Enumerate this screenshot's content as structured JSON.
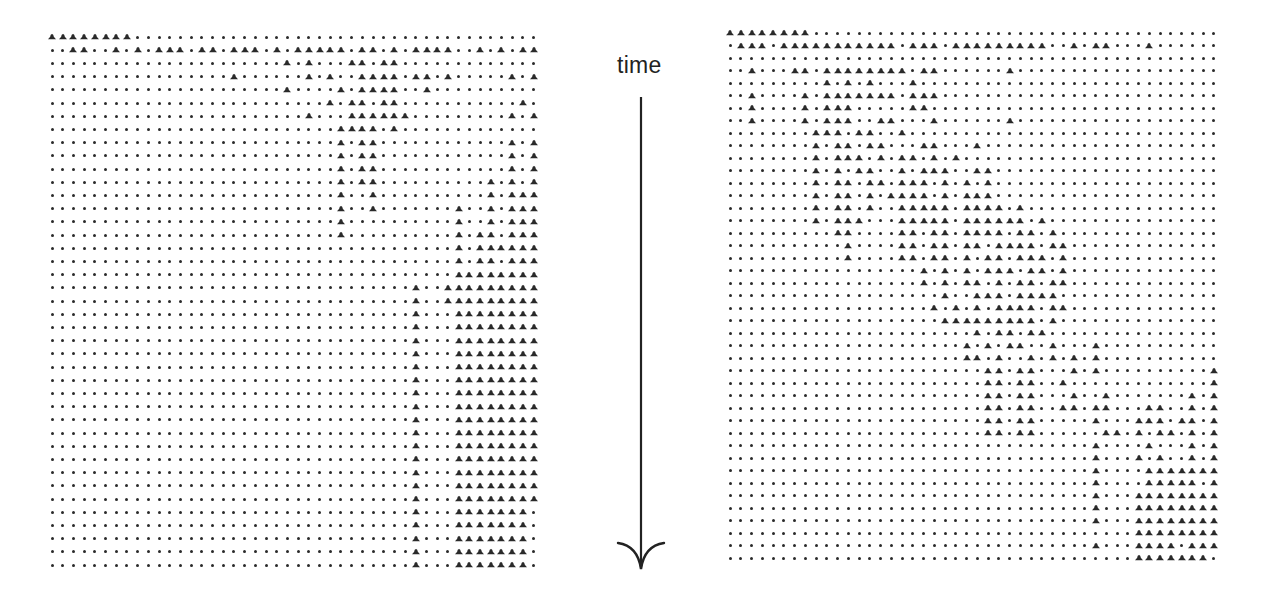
{
  "figure": {
    "axis_label": "time",
    "arrow_direction": "down",
    "symbol_legend": {
      "1": "triangle-marker",
      "0": "dot-marker"
    },
    "ink_color": "#2a2a2a"
  },
  "panels": [
    {
      "id": "left",
      "origin": [
        52,
        37
      ],
      "col_step": 10.7,
      "row_step": 13.2,
      "rows": [
        "1111111100000000000000000000000000000000000000",
        "0011001010111011011101011111011010111100101011",
        "0000000000000000000000101000110110000000000000",
        "0000000000000000010000001010011110110100000101",
        "0000000000000000000000100001011110010000000000",
        "0000000000000000000000000010110110000000000010",
        "0000000000000000000000001000111111000000000101",
        "0000000000000000000000000001111010000000000000",
        "0000000000000000000000000001011000000000000101",
        "0000000000000000000000000001011000000000000101",
        "0000000000000000000000000001011000000000000101",
        "0000000000000000000000000001011000000000010101",
        "0000000000000000000000000001001000000000010111",
        "0000000000000000000000000001001000000010010111",
        "0000000000000000000000000001000000000010010111",
        "0000000000000000000000000001000000000010110111",
        "0000000000000000000000000000000000000010111111",
        "0000000000000000000000000000000000000010110111",
        "0000000000000000000000000000000000000011111111",
        "0000000000000000000000000000000000100111111111",
        "0000000000000000000000000000000000100111111111",
        "0000000000000000000000000000000000100011111111",
        "0000000000000000000000000000000000100011111111",
        "0000000000000000000000000000000000100011111111",
        "0000000000000000000000000000000000100011111111",
        "0000000000000000000000000000000000100011111111",
        "0000000000000000000000000000000000100011111111",
        "0000000000000000000000000000000000100011111111",
        "0000000000000000000000000000000000100011111111",
        "0000000000000000000000000000000000100011111111",
        "0000000000000000000000000000000000100011111111",
        "0000000000000000000000000000000000100011111111",
        "0000000000000000000000000000000000100011111111",
        "0000000000000000000000000000000000100011111111",
        "0000000000000000000000000000000000100011111111",
        "0000000000000000000000000000000000100011111111",
        "0000000000000000000000000000000000100011111110",
        "0000000000000000000000000000000000100011111110",
        "0000000000000000000000000000000000100011111110",
        "0000000000000000000000000000000000100011111110",
        "0000000000000000000000000000000000100011111110"
      ]
    },
    {
      "id": "right",
      "origin": [
        730,
        33
      ],
      "col_step": 10.75,
      "row_step": 12.5,
      "rows": [
        "1111111100000000000000000000000000000000000000",
        "0111011111111111011101111111110010110001000000",
        "0000000000000000000000000000000000000000000000",
        "0010001101111111101100000010000000000000000000",
        "0000000001010100010000000000000000000000000000",
        "0010000101111111011100000000000000000000000000",
        "0010000101110000011000000000000000000000000000",
        "0010000101110011000100000010000000000000000000",
        "0000000011101100100000000000000000000000000000",
        "0000000010110110001100010000000000000000000000",
        "0000000010111010110101000000000000000000000000",
        "0000000010101100101110011000000000000000000000",
        "0000000010110110111010101000000000000000000000",
        "0000000010110101111010111000000000000000000000",
        "0000000010110100111110111101000000000000000000",
        "0000000010111000111110111111010000000000000000",
        "0000000000110000110110111101101000000000000000",
        "0000000000010000110110110111101100000000000000",
        "0000000000010000110110101101110100000000000000",
        "0000000000000000001010101110110100000000000000",
        "0000000000000000001010110101101100000000000000",
        "0000000000000000000010011101111000000000000000",
        "0000000000000000000101010111101100000000000000",
        "0000000000000000000011111111101000000000000000",
        "0000000000000000000000010110110000000000000000",
        "0000000000000000000000101011001000100000000000",
        "0000000000000000000000110100101010100000000000",
        "0000000000000000000000001101100010100000000001",
        "0000000000000000000000001101100100000000000001",
        "0000000000000000000000001101100010010000000101",
        "0000000000000000000000001101100110110001100101",
        "0000000000000000000000001101100000100011101101",
        "0000000000000000000000001101100000011010110101",
        "0000000000000000000000000000000000100001000101",
        "0000000000000000000000000000000000100010100101",
        "0000000000000000000000000000000000100001111111",
        "0000000000000000000000000000000000100001111101",
        "0000000000000000000000000000000000100011111111",
        "0000000000000000000000000000000000100011111111",
        "0000000000000000000000000000000000100011111111",
        "0000000000000000000000000000000000000011111111",
        "0000000000000000000000000000000000100011110111",
        "0000000000000000000000000000000000000011111110"
      ]
    }
  ]
}
